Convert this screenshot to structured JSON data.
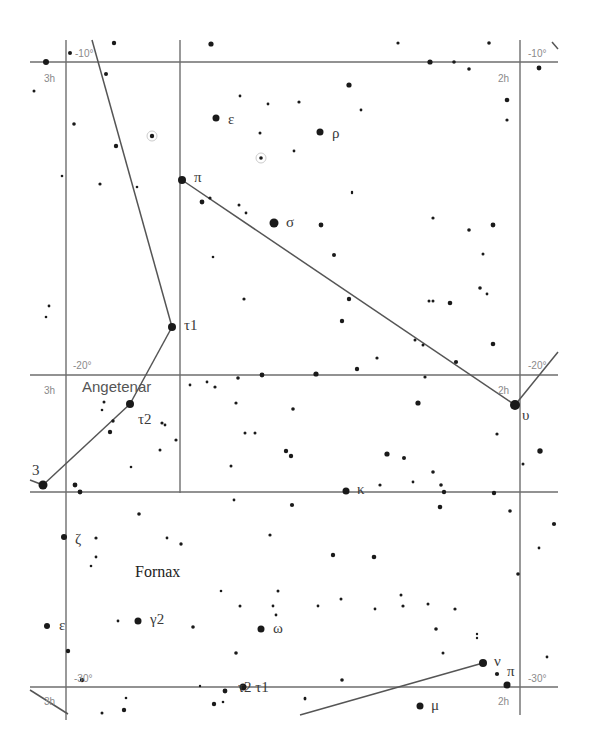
{
  "chart": {
    "width": 592,
    "height": 749,
    "colors": {
      "grid": "#6e6e6e",
      "star": "#1a1a1a",
      "label": "#3a3a3a",
      "grid_label": "#8a8a8a"
    }
  },
  "grid": {
    "horizontal": [
      {
        "y": 62,
        "x1": 30,
        "x2": 558
      },
      {
        "y": 375,
        "x1": 30,
        "x2": 558
      },
      {
        "y": 492,
        "x1": 30,
        "x2": 558
      },
      {
        "y": 687,
        "x1": 30,
        "x2": 558
      }
    ],
    "vertical": [
      {
        "x": 66,
        "y1": 40,
        "y2": 720
      },
      {
        "x": 180,
        "y1": 40,
        "y2": 493
      },
      {
        "x": 520,
        "y1": 40,
        "y2": 715
      }
    ]
  },
  "grid_labels": [
    {
      "id": "dec-minus10-left",
      "text": "-10°",
      "x": 75,
      "y": 57
    },
    {
      "id": "ra-3h-top",
      "text": "3h",
      "x": 44,
      "y": 82
    },
    {
      "id": "dec-minus10-right",
      "text": "-10°",
      "x": 528,
      "y": 57
    },
    {
      "id": "ra-2h-top",
      "text": "2h",
      "x": 498,
      "y": 82
    },
    {
      "id": "dec-minus20-left",
      "text": "-20°",
      "x": 73,
      "y": 369
    },
    {
      "id": "ra-3h-mid",
      "text": "3h",
      "x": 44,
      "y": 394
    },
    {
      "id": "dec-minus20-right",
      "text": "-20°",
      "x": 528,
      "y": 369
    },
    {
      "id": "ra-2h-mid",
      "text": "2h",
      "x": 498,
      "y": 394
    },
    {
      "id": "dec-minus30-left",
      "text": "-30°",
      "x": 74,
      "y": 682
    },
    {
      "id": "ra-3h-bottom",
      "text": "3h",
      "x": 44,
      "y": 705
    },
    {
      "id": "dec-minus30-right",
      "text": "-30°",
      "x": 528,
      "y": 682
    },
    {
      "id": "ra-2h-bottom",
      "text": "2h",
      "x": 498,
      "y": 705
    }
  ],
  "constellation_lines": [
    {
      "id": "eridanus-upper",
      "points": [
        [
          92,
          40
        ],
        [
          172,
          327
        ]
      ]
    },
    {
      "id": "eridanus-tau1-tau2",
      "points": [
        [
          172,
          327
        ],
        [
          130,
          404
        ]
      ]
    },
    {
      "id": "eridanus-tau2-3",
      "points": [
        [
          130,
          404
        ],
        [
          43,
          485
        ]
      ]
    },
    {
      "id": "eridanus-3-tail",
      "points": [
        [
          43,
          485
        ],
        [
          30,
          480
        ]
      ]
    },
    {
      "id": "cetus-pi-upsilon",
      "points": [
        [
          182,
          180
        ],
        [
          515,
          405
        ]
      ]
    },
    {
      "id": "cetus-upsilon-ext",
      "points": [
        [
          515,
          405
        ],
        [
          558,
          352
        ]
      ]
    },
    {
      "id": "fornax-nu-line",
      "points": [
        [
          483,
          663
        ],
        [
          300,
          715
        ]
      ]
    },
    {
      "id": "bottom-left-tail",
      "points": [
        [
          30,
          690
        ],
        [
          68,
          714
        ]
      ]
    },
    {
      "id": "top-right-tick",
      "points": [
        [
          552,
          42
        ],
        [
          558,
          49
        ]
      ]
    }
  ],
  "named_stars": [
    {
      "name": "epsilon-cet",
      "label": "ε",
      "x": 216,
      "y": 118,
      "r": 3.5,
      "lx": 228,
      "ly": 124
    },
    {
      "name": "rho-cet",
      "label": "ρ",
      "x": 320,
      "y": 132,
      "r": 3.5,
      "lx": 332,
      "ly": 138
    },
    {
      "name": "pi-cet",
      "label": "π",
      "x": 182,
      "y": 180,
      "r": 4,
      "lx": 194,
      "ly": 182
    },
    {
      "name": "sigma-cet",
      "label": "σ",
      "x": 274,
      "y": 223,
      "r": 4.5,
      "lx": 286,
      "ly": 227
    },
    {
      "name": "tau1-eri",
      "label": "τ1",
      "x": 172,
      "y": 327,
      "r": 4,
      "lx": 184,
      "ly": 330
    },
    {
      "name": "tau2-eri",
      "label": "τ2",
      "x": 130,
      "y": 404,
      "r": 4,
      "lx": 138,
      "ly": 424
    },
    {
      "name": "upsilon-cet",
      "label": "υ",
      "x": 515,
      "y": 405,
      "r": 5,
      "lx": 522,
      "ly": 420
    },
    {
      "name": "tau3-eri",
      "label": "3",
      "x": 43,
      "y": 485,
      "r": 4.5,
      "lx": 32,
      "ly": 475
    },
    {
      "name": "kappa-for",
      "label": "κ",
      "x": 346,
      "y": 491,
      "r": 3.5,
      "lx": 357,
      "ly": 494
    },
    {
      "name": "zeta-for",
      "label": "ζ",
      "x": 64,
      "y": 537,
      "r": 3,
      "lx": 75,
      "ly": 544
    },
    {
      "name": "gamma2-for",
      "label": "γ2",
      "x": 138,
      "y": 621,
      "r": 3.5,
      "lx": 150,
      "ly": 624
    },
    {
      "name": "epsilon-for",
      "label": "ε",
      "x": 47,
      "y": 626,
      "r": 3,
      "lx": 59,
      "ly": 630
    },
    {
      "name": "omega-for",
      "label": "ω",
      "x": 261,
      "y": 629,
      "r": 3.5,
      "lx": 273,
      "ly": 633
    },
    {
      "name": "tau2-tau1-for",
      "label": "τ2 τ1",
      "x": 243,
      "y": 687,
      "r": 3.5,
      "lx": 238,
      "ly": 692
    },
    {
      "name": "nu-for",
      "label": "ν",
      "x": 483,
      "y": 663,
      "r": 4,
      "lx": 494,
      "ly": 666
    },
    {
      "name": "pi-for",
      "label": "π",
      "x": 507,
      "y": 685,
      "r": 3.5,
      "lx": 507,
      "ly": 676
    },
    {
      "name": "mu-for",
      "label": "μ",
      "x": 420,
      "y": 706,
      "r": 3.5,
      "lx": 431,
      "ly": 710
    }
  ],
  "constellation_names": [
    {
      "id": "angetenar-label",
      "text": "Angetenar",
      "x": 82,
      "y": 392,
      "style": "sans"
    },
    {
      "id": "fornax-label",
      "text": "Fornax",
      "x": 135,
      "y": 577,
      "style": "serif"
    }
  ],
  "stars": [
    [
      46,
      62,
      3
    ],
    [
      70,
      53,
      2
    ],
    [
      114,
      43,
      2.2
    ],
    [
      211,
      44,
      2.6
    ],
    [
      398,
      43,
      1.6
    ],
    [
      430,
      62,
      2.6
    ],
    [
      454,
      62,
      1.8
    ],
    [
      469,
      69,
      1.8
    ],
    [
      489,
      43,
      1.8
    ],
    [
      539,
      68,
      2.4
    ],
    [
      34,
      91,
      1.5
    ],
    [
      106,
      74,
      2
    ],
    [
      74,
      124,
      1.8
    ],
    [
      116,
      146,
      2.2
    ],
    [
      152,
      136,
      2.2
    ],
    [
      62,
      176,
      1.3
    ],
    [
      100,
      184,
      1.6
    ],
    [
      137,
      187,
      1.3
    ],
    [
      240,
      96,
      1.4
    ],
    [
      268,
      104,
      1.4
    ],
    [
      299,
      102,
      1.6
    ],
    [
      349,
      85,
      2.6
    ],
    [
      361,
      110,
      1.4
    ],
    [
      260,
      133,
      1.5
    ],
    [
      261,
      158,
      1.8
    ],
    [
      294,
      151,
      1.4
    ],
    [
      202,
      202,
      2.4
    ],
    [
      210,
      198,
      1.6
    ],
    [
      239,
      205,
      1.5
    ],
    [
      246,
      213,
      1.4
    ],
    [
      321,
      225,
      2.4
    ],
    [
      352,
      192,
      1.2
    ],
    [
      352,
      193,
      1.2
    ],
    [
      507,
      100,
      2.3
    ],
    [
      507,
      120,
      1.6
    ],
    [
      433,
      218,
      1.6
    ],
    [
      469,
      230,
      1.8
    ],
    [
      493,
      225,
      2.4
    ],
    [
      483,
      254,
      1.5
    ],
    [
      480,
      288,
      1.8
    ],
    [
      487,
      294,
      1.4
    ],
    [
      213,
      257,
      1.3
    ],
    [
      244,
      299,
      1.6
    ],
    [
      334,
      255,
      2
    ],
    [
      349,
      299,
      2.2
    ],
    [
      342,
      321,
      2.2
    ],
    [
      429,
      301,
      1.5
    ],
    [
      433,
      301,
      1.5
    ],
    [
      450,
      303,
      2.3
    ],
    [
      49,
      306,
      1.4
    ],
    [
      46,
      317,
      1.3
    ],
    [
      415,
      340,
      1.5
    ],
    [
      423,
      345,
      1.5
    ],
    [
      377,
      358,
      1.6
    ],
    [
      425,
      377,
      1.6
    ],
    [
      456,
      362,
      2.1
    ],
    [
      493,
      344,
      2.3
    ],
    [
      190,
      385,
      1.4
    ],
    [
      207,
      382,
      1.4
    ],
    [
      215,
      387,
      1.6
    ],
    [
      238,
      378,
      1.8
    ],
    [
      262,
      375,
      2.4
    ],
    [
      316,
      374,
      2.6
    ],
    [
      357,
      369,
      2.2
    ],
    [
      104,
      402,
      1.5
    ],
    [
      102,
      410,
      1.3
    ],
    [
      113,
      421,
      1.7
    ],
    [
      110,
      432,
      2.2
    ],
    [
      162,
      423,
      1.6
    ],
    [
      165,
      425,
      1.4
    ],
    [
      176,
      440,
      1.6
    ],
    [
      160,
      450,
      1.5
    ],
    [
      131,
      467,
      1.3
    ],
    [
      75,
      485,
      2.4
    ],
    [
      80,
      492,
      2.4
    ],
    [
      236,
      403,
      1.6
    ],
    [
      245,
      433,
      1.5
    ],
    [
      255,
      433,
      1.5
    ],
    [
      293,
      409,
      1.8
    ],
    [
      286,
      451,
      2.2
    ],
    [
      291,
      456,
      2.2
    ],
    [
      231,
      466,
      1.5
    ],
    [
      418,
      403,
      2.6
    ],
    [
      433,
      472,
      1.8
    ],
    [
      441,
      485,
      1.8
    ],
    [
      387,
      454,
      2.6
    ],
    [
      404,
      458,
      2
    ],
    [
      380,
      485,
      1.6
    ],
    [
      413,
      482,
      1.4
    ],
    [
      444,
      492,
      2.2
    ],
    [
      497,
      434,
      1.6
    ],
    [
      540,
      451,
      2.7
    ],
    [
      523,
      464,
      1.5
    ],
    [
      139,
      514,
      1.8
    ],
    [
      96,
      538,
      1.6
    ],
    [
      167,
      538,
      1.4
    ],
    [
      181,
      544,
      1.7
    ],
    [
      96,
      557,
      1.4
    ],
    [
      91,
      566,
      1.3
    ],
    [
      292,
      505,
      2.1
    ],
    [
      234,
      500,
      1.4
    ],
    [
      270,
      535,
      1.6
    ],
    [
      333,
      555,
      2.2
    ],
    [
      374,
      557,
      2.3
    ],
    [
      440,
      507,
      2.3
    ],
    [
      494,
      493,
      2.2
    ],
    [
      510,
      511,
      1.8
    ],
    [
      554,
      524,
      2.1
    ],
    [
      539,
      548,
      1.4
    ],
    [
      518,
      574,
      1.8
    ],
    [
      118,
      621,
      1.4
    ],
    [
      193,
      627,
      1.8
    ],
    [
      221,
      591,
      1.3
    ],
    [
      240,
      606,
      1.5
    ],
    [
      278,
      591,
      1.5
    ],
    [
      273,
      606,
      1.4
    ],
    [
      276,
      615,
      1.4
    ],
    [
      236,
      653,
      1.8
    ],
    [
      318,
      606,
      1.4
    ],
    [
      341,
      599,
      1.5
    ],
    [
      401,
      595,
      1.5
    ],
    [
      375,
      609,
      1.4
    ],
    [
      403,
      606,
      1.6
    ],
    [
      455,
      609,
      1.6
    ],
    [
      428,
      604,
      1.5
    ],
    [
      436,
      629,
      1.8
    ],
    [
      477,
      634,
      1.2
    ],
    [
      477,
      638,
      1.2
    ],
    [
      443,
      653,
      1.5
    ],
    [
      342,
      680,
      1.8
    ],
    [
      305,
      699,
      1.4
    ],
    [
      497,
      674,
      2.1
    ],
    [
      547,
      657,
      1.4
    ],
    [
      68,
      651,
      2.2
    ],
    [
      82,
      680,
      2.2
    ],
    [
      102,
      713,
      1.5
    ],
    [
      126,
      698,
      1.3
    ],
    [
      124,
      710,
      2.2
    ],
    [
      200,
      686,
      1.2
    ],
    [
      214,
      704,
      2.2
    ],
    [
      225,
      691,
      2.4
    ],
    [
      223,
      702,
      1.3
    ],
    [
      305,
      698,
      1.3
    ]
  ],
  "halos": [
    [
      152,
      136,
      5
    ],
    [
      261,
      158,
      5
    ]
  ]
}
